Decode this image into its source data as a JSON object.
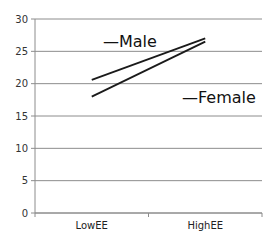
{
  "chart_data": {
    "type": "line",
    "title": "",
    "xlabel": "",
    "ylabel": "",
    "categories": [
      "LowEE",
      "HighEE"
    ],
    "series": [
      {
        "name": "Male",
        "values": [
          20.6,
          27.0
        ],
        "color": "#1a1a1a"
      },
      {
        "name": "Female",
        "values": [
          18.0,
          26.5
        ],
        "color": "#1a1a1a"
      }
    ],
    "ylim": [
      0,
      30
    ],
    "yticks": [
      0,
      5,
      10,
      15,
      20,
      25,
      30
    ],
    "grid": true,
    "legend": {
      "position": "inline-labels",
      "entries": [
        "Male",
        "Female"
      ]
    }
  },
  "labels": {
    "male": "—Male",
    "female": "—Female"
  }
}
